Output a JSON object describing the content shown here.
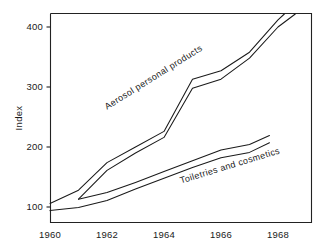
{
  "chart_data": {
    "type": "line",
    "title": "",
    "xlabel": "",
    "ylabel": "Index",
    "xlim": [
      1960,
      1968.8
    ],
    "ylim": [
      85,
      435
    ],
    "grid": false,
    "legend_position": "inline-annotations",
    "x_ticks": [
      "1960",
      "1962",
      "1964",
      "1966",
      "1968"
    ],
    "x_tick_values": [
      1960,
      1962,
      1964,
      1966,
      1968
    ],
    "y_ticks": [
      "100",
      "200",
      "300",
      "400"
    ],
    "y_tick_values": [
      100,
      200,
      300,
      400
    ],
    "annotations": [
      {
        "text": "Aerosol personal products",
        "x": 1962.0,
        "y": 262,
        "rotation": -32
      },
      {
        "text": "Toiletries and cosmetics",
        "x": 1964.6,
        "y": 139,
        "rotation": -17
      }
    ],
    "series": [
      {
        "name": "Aerosol personal products (upper)",
        "x": [
          1960,
          1961,
          1962,
          1963,
          1964,
          1965,
          1966,
          1967,
          1968,
          1968.3
        ],
        "values": [
          106,
          128,
          174,
          200,
          226,
          313,
          327,
          358,
          412,
          425
        ]
      },
      {
        "name": "Aerosol personal products (lower)",
        "x": [
          1961,
          1962,
          1963,
          1964,
          1965,
          1966,
          1967,
          1968,
          1968.7
        ],
        "values": [
          113,
          161,
          190,
          216,
          298,
          313,
          348,
          400,
          425
        ]
      },
      {
        "name": "Toiletries and cosmetics (upper)",
        "x": [
          1961,
          1962,
          1963,
          1964,
          1965,
          1966,
          1967,
          1967.7
        ],
        "values": [
          113,
          124,
          141,
          159,
          177,
          195,
          204,
          219
        ]
      },
      {
        "name": "Toiletries and cosmetics (lower)",
        "x": [
          1960,
          1961,
          1962,
          1963,
          1964,
          1965,
          1966,
          1967,
          1967.7
        ],
        "values": [
          94,
          99,
          111,
          130,
          148,
          166,
          182,
          191,
          207
        ]
      }
    ]
  },
  "axis": {
    "y_title": "Index"
  }
}
